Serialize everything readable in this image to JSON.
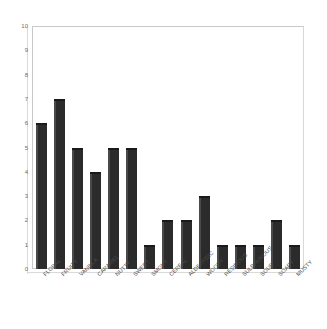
{
  "chart_data": {
    "type": "bar",
    "title": "",
    "subtitle": "",
    "xlabel": "",
    "ylabel": "",
    "ylim": [
      0,
      10
    ],
    "ytick_step": 1,
    "yticks": [
      "10",
      "9",
      "8",
      "7",
      "6",
      "5",
      "4",
      "3",
      "2",
      "1",
      "0"
    ],
    "grid": false,
    "legend": false,
    "legend_position": "none",
    "bar_color": "#2b2b2b",
    "background_color": "#ffffff",
    "axis_color": "#c9c9c9",
    "tick_label_color": "#6d6d6d",
    "category_label_color": "#4a4a4a",
    "category_label_rotation": -45,
    "style": "3d-column",
    "categories": [
      "FLORAL",
      "FRUITY",
      "VANILLA",
      "CARAMEL",
      "NUTTY",
      "SWEET",
      "SMOKY",
      "CEREAL",
      "ALDEHYDIC",
      "WOODY",
      "RESINOUS",
      "SULPHUROUS",
      "SOUR",
      "SOAPY",
      "MUSTY"
    ],
    "values": [
      6,
      7,
      5,
      4,
      5,
      5,
      1,
      2,
      2,
      3,
      1,
      1,
      1,
      2,
      1
    ]
  }
}
